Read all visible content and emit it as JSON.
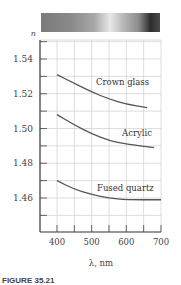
{
  "chart_data": {
    "type": "line",
    "title": "",
    "xlabel": "λ, nm",
    "ylabel": "n",
    "xlim": [
      350,
      700
    ],
    "ylim": [
      1.45,
      1.55
    ],
    "xticks": [
      400,
      500,
      600,
      700
    ],
    "yticks": [
      1.46,
      1.48,
      1.5,
      1.52,
      1.54
    ],
    "grid": true,
    "series": [
      {
        "name": "Crown glass",
        "x": [
          400,
          450,
          500,
          550,
          600,
          660
        ],
        "values": [
          1.531,
          1.526,
          1.521,
          1.517,
          1.514,
          1.512
        ]
      },
      {
        "name": "Acrylic",
        "x": [
          400,
          450,
          500,
          550,
          600,
          680
        ],
        "values": [
          1.508,
          1.502,
          1.497,
          1.493,
          1.491,
          1.489
        ]
      },
      {
        "name": "Fused quartz",
        "x": [
          400,
          450,
          500,
          550,
          600,
          700
        ],
        "values": [
          1.47,
          1.465,
          1.462,
          1.46,
          1.459,
          1.459
        ]
      }
    ],
    "labels": {
      "crown": "Crown glass",
      "acrylic": "Acrylic",
      "quartz": "Fused quartz"
    },
    "tick_labels": {
      "y": [
        "1.54",
        "1.52",
        "1.50",
        "1.48",
        "1.46"
      ],
      "x": [
        "400",
        "500",
        "600",
        "700"
      ]
    },
    "axis_labels": {
      "y": "n",
      "x": "λ, nm"
    }
  },
  "caption": "FIGURE 35.21"
}
